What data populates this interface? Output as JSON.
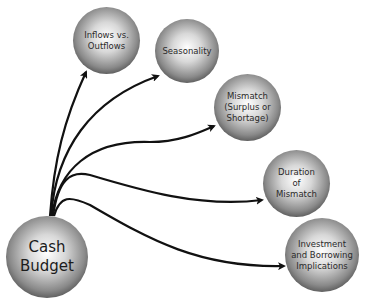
{
  "diagram": {
    "root": {
      "label": "Cash\nBudget"
    },
    "nodes": [
      {
        "label": "Inflows vs.\nOutflows"
      },
      {
        "label": "Seasonality"
      },
      {
        "label": "Mismatch\n(Surplus or\nShortage)"
      },
      {
        "label": "Duration\nof\nMismatch"
      },
      {
        "label": "Investment\nand Borrowing\nImplications"
      }
    ],
    "edges": [
      {
        "from": "Cash Budget",
        "to": "Inflows vs. Outflows"
      },
      {
        "from": "Cash Budget",
        "to": "Seasonality"
      },
      {
        "from": "Cash Budget",
        "to": "Mismatch (Surplus or Shortage)"
      },
      {
        "from": "Cash Budget",
        "to": "Duration of Mismatch"
      },
      {
        "from": "Cash Budget",
        "to": "Investment and Borrowing Implications"
      }
    ]
  }
}
